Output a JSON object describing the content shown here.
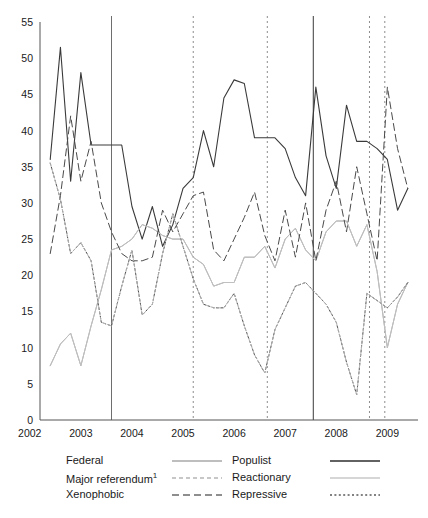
{
  "chart_data": {
    "type": "line",
    "title": "",
    "xlabel": "",
    "ylabel": "",
    "xlim": [
      2002.2,
      2009.6
    ],
    "ylim": [
      0,
      55
    ],
    "yticks": [
      0,
      5,
      10,
      15,
      20,
      25,
      30,
      35,
      40,
      45,
      50,
      55
    ],
    "xticks": [
      2002,
      2003,
      2004,
      2005,
      2006,
      2007,
      2008,
      2009
    ],
    "xtick_labels": [
      "2002",
      "2003",
      "2004",
      "2005",
      "2006",
      "2007",
      "2008",
      "2009"
    ],
    "grid": false,
    "legend_position": "below",
    "vlines": [
      {
        "x": 2003.6,
        "style": "solid",
        "color": "#6e6e6e"
      },
      {
        "x": 2005.2,
        "style": "dotted",
        "color": "#8c8c8c"
      },
      {
        "x": 2006.65,
        "style": "dotted",
        "color": "#8c8c8c"
      },
      {
        "x": 2007.55,
        "style": "solid",
        "color": "#3a3a3a"
      },
      {
        "x": 2008.65,
        "style": "dotted",
        "color": "#8c8c8c"
      },
      {
        "x": 2008.95,
        "style": "dotted",
        "color": "#8c8c8c"
      }
    ],
    "x": [
      2002.4,
      2002.6,
      2002.8,
      2003.0,
      2003.2,
      2003.4,
      2003.6,
      2003.8,
      2004.0,
      2004.2,
      2004.4,
      2004.6,
      2004.8,
      2005.0,
      2005.2,
      2005.4,
      2005.6,
      2005.8,
      2006.0,
      2006.2,
      2006.4,
      2006.6,
      2006.8,
      2007.0,
      2007.2,
      2007.4,
      2007.6,
      2007.8,
      2008.0,
      2008.2,
      2008.4,
      2008.6,
      2008.8,
      2009.0,
      2009.2,
      2009.4
    ],
    "series": [
      {
        "name": "Populist",
        "color": "#3a3a3a",
        "dash": "solid",
        "width": 1.1,
        "values": [
          36.0,
          51.5,
          33.0,
          48.0,
          38.0,
          38.0,
          38.0,
          38.0,
          29.5,
          25.0,
          29.5,
          24.0,
          27.0,
          32.0,
          33.5,
          40.0,
          35.0,
          44.5,
          47.0,
          46.5,
          39.0,
          39.0,
          39.0,
          37.5,
          33.5,
          31.0,
          46.0,
          36.5,
          32.0,
          43.5,
          38.5,
          38.5,
          37.5,
          36.0,
          29.0,
          32.0
        ]
      },
      {
        "name": "Federal",
        "color": "#a8a8a8",
        "dash": "solid",
        "width": 1.0,
        "values": [
          7.5,
          10.5,
          12.0,
          7.5,
          13.0,
          18.0,
          23.5,
          24.0,
          25.0,
          27.0,
          26.5,
          25.5,
          25.0,
          25.0,
          22.5,
          21.5,
          18.5,
          19.0,
          19.0,
          22.5,
          22.5,
          24.0,
          21.0,
          25.0,
          26.5,
          23.5,
          22.0,
          26.0,
          27.5,
          27.5,
          24.0,
          27.0,
          20.5,
          10.0,
          16.0,
          19.0
        ]
      },
      {
        "name": "Reactionary",
        "color": "#c0c0c0",
        "dash": "solid",
        "width": 1.0,
        "values": [
          7.5,
          10.5,
          12.0,
          7.5,
          13.0,
          18.0,
          23.5,
          24.0,
          25.0,
          27.0,
          26.5,
          25.5,
          25.0,
          25.0,
          22.5,
          21.5,
          18.5,
          19.0,
          19.0,
          22.5,
          22.5,
          24.0,
          21.0,
          25.0,
          26.5,
          23.5,
          22.0,
          26.0,
          27.5,
          27.5,
          24.0,
          27.0,
          20.5,
          10.0,
          16.0,
          19.0
        ]
      },
      {
        "name": "Xenophobic",
        "color": "#4a4a4a",
        "dash": "dashed-long",
        "width": 1.0,
        "values": [
          23.0,
          31.0,
          42.0,
          33.0,
          38.5,
          30.0,
          26.0,
          23.0,
          22.0,
          22.0,
          22.5,
          29.0,
          26.0,
          28.5,
          31.0,
          31.5,
          23.5,
          22.0,
          25.0,
          28.0,
          31.5,
          25.5,
          22.0,
          29.0,
          22.5,
          30.0,
          22.0,
          29.0,
          33.0,
          26.0,
          35.0,
          28.5,
          22.0,
          46.0,
          37.5,
          32.0
        ]
      },
      {
        "name": "Repressive",
        "color": "#4a4a4a",
        "dash": "dotted",
        "width": 1.0,
        "values": [
          35.5,
          30.5,
          23.0,
          24.5,
          22.0,
          13.5,
          13.0,
          18.5,
          23.5,
          14.5,
          16.0,
          23.0,
          28.5,
          24.0,
          19.5,
          16.0,
          15.5,
          15.5,
          17.5,
          13.0,
          9.0,
          6.5,
          12.5,
          15.5,
          18.5,
          19.0,
          17.5,
          16.0,
          13.5,
          8.0,
          3.5,
          17.5,
          16.5,
          15.5,
          17.0,
          19.0
        ]
      },
      {
        "name": "Major referendum",
        "color": "#b5b5b5",
        "dash": "dashed-fine",
        "width": 1.0,
        "values": [
          35.5,
          30.5,
          23.0,
          24.5,
          22.0,
          13.5,
          13.0,
          18.5,
          23.5,
          14.5,
          16.0,
          23.0,
          28.5,
          24.0,
          19.5,
          16.0,
          15.5,
          15.5,
          17.5,
          13.0,
          9.0,
          6.5,
          12.5,
          15.5,
          18.5,
          19.0,
          17.5,
          16.0,
          13.5,
          8.0,
          3.5,
          17.5,
          16.5,
          15.5,
          17.0,
          19.0
        ]
      }
    ]
  },
  "legend": {
    "left_column": [
      {
        "label": "Federal",
        "key": "federal"
      },
      {
        "label": "Major referendum",
        "sup": "1",
        "key": "major-referendum"
      },
      {
        "label": "Xenophobic",
        "key": "xenophobic"
      }
    ],
    "right_column": [
      {
        "label": "Populist",
        "key": "populist"
      },
      {
        "label": "Reactionary",
        "key": "reactionary"
      },
      {
        "label": "Repressive",
        "key": "repressive"
      }
    ]
  }
}
